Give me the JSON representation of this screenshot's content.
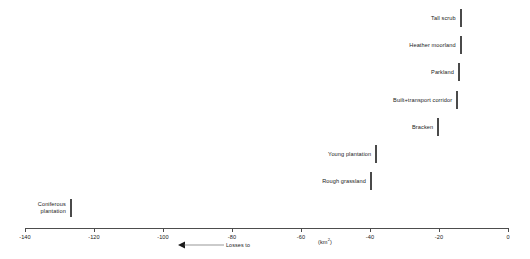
{
  "chart_data": {
    "type": "bar",
    "orientation": "horizontal",
    "title": "",
    "subtitle": "",
    "xlabel": "(km2)",
    "ylabel": "",
    "xlim": [
      -140,
      0
    ],
    "grid": false,
    "legend": null,
    "annotation": {
      "arrow_direction": "left",
      "text": "Losses to"
    },
    "units_label": "(km",
    "units_superscript": "2",
    "units_label_close": ")",
    "tick_labels": [
      "-140",
      "-120",
      "-100",
      "-80",
      "-60",
      "-40",
      "-20",
      "0"
    ],
    "tick_values": [
      -140,
      -120,
      -100,
      -80,
      -60,
      -40,
      -20,
      0
    ],
    "categories": [
      "Tall scrub",
      "Heather moorland",
      "Parkland",
      "Built+transport corridor",
      "Bracken",
      "Young plantation",
      "Rough grassland",
      "Coniferous plantation"
    ],
    "values": [
      -14,
      -14,
      -14.5,
      -15,
      -20.5,
      -38.5,
      -40,
      -127
    ],
    "bars": [
      {
        "label": "Tall scrub",
        "value": -14,
        "two_line": false
      },
      {
        "label": "Heather moorland",
        "value": -14,
        "two_line": false
      },
      {
        "label": "Parkland",
        "value": -14.5,
        "two_line": false
      },
      {
        "label": "Built+transport corridor",
        "value": -15,
        "two_line": false
      },
      {
        "label": "Bracken",
        "value": -20.5,
        "two_line": false
      },
      {
        "label": "Young plantation",
        "value": -38.5,
        "two_line": false
      },
      {
        "label": "Rough grassland",
        "value": -40,
        "two_line": false
      },
      {
        "label": "Coniferous plantation",
        "value": -127,
        "two_line": true
      }
    ],
    "colors": {
      "bar_fill": "#6e6e6e",
      "bar_stroke": "#4a4a4a",
      "axis": "#4d4d4d",
      "text": "#1a1a1a",
      "background": "#ffffff"
    }
  }
}
